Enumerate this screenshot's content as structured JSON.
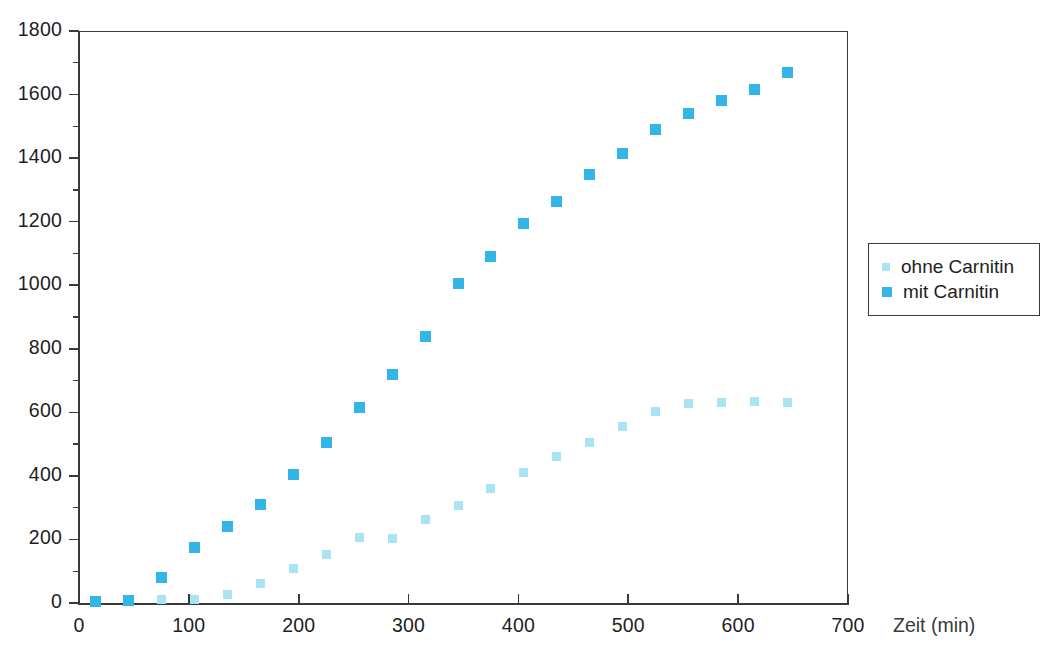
{
  "chart_data": {
    "type": "scatter",
    "title": "",
    "xlabel": "Zeit (min)",
    "ylabel": "",
    "xlim": [
      0,
      700
    ],
    "ylim": [
      0,
      1800
    ],
    "xticks": [
      0,
      100,
      200,
      300,
      400,
      500,
      600,
      700
    ],
    "yticks": [
      0,
      200,
      400,
      600,
      800,
      1000,
      1200,
      1400,
      1600,
      1800
    ],
    "grid": false,
    "legend_position": "right",
    "colors": {
      "ohne_carnitin": "#a9e4f3",
      "mit_carnitin": "#33b5e8",
      "axis": "#3a3a3a",
      "text": "#1e1e1e",
      "background": "#ffffff"
    },
    "series": [
      {
        "name": "ohne Carnitin",
        "color": "#a9e4f3",
        "marker": "square",
        "x": [
          15,
          45,
          75,
          105,
          135,
          165,
          195,
          225,
          255,
          285,
          315,
          345,
          375,
          405,
          435,
          465,
          495,
          525,
          555,
          585,
          615,
          645
        ],
        "values": [
          5,
          8,
          10,
          12,
          28,
          62,
          110,
          152,
          205,
          202,
          262,
          308,
          360,
          412,
          460,
          505,
          555,
          602,
          628,
          632,
          633,
          632
        ]
      },
      {
        "name": "mit Carnitin",
        "color": "#33b5e8",
        "marker": "square",
        "x": [
          15,
          45,
          75,
          105,
          135,
          165,
          195,
          225,
          255,
          285,
          315,
          345,
          375,
          405,
          435,
          465,
          495,
          525,
          555,
          585,
          615,
          645
        ],
        "values": [
          5,
          8,
          80,
          175,
          240,
          310,
          405,
          505,
          615,
          720,
          840,
          1005,
          1090,
          1195,
          1265,
          1350,
          1415,
          1490,
          1540,
          1580,
          1615,
          1670
        ]
      }
    ]
  },
  "legend": {
    "items": [
      {
        "label": "ohne Carnitin",
        "color": "#a9e4f3"
      },
      {
        "label": "mit Carnitin",
        "color": "#33b5e8"
      }
    ]
  },
  "axes": {
    "x_title": "Zeit (min)",
    "x_tick_labels": [
      "0",
      "100",
      "200",
      "300",
      "400",
      "500",
      "600",
      "700"
    ],
    "y_tick_labels": [
      "0",
      "200",
      "400",
      "600",
      "800",
      "1000",
      "1200",
      "1400",
      "1600",
      "1800"
    ]
  }
}
